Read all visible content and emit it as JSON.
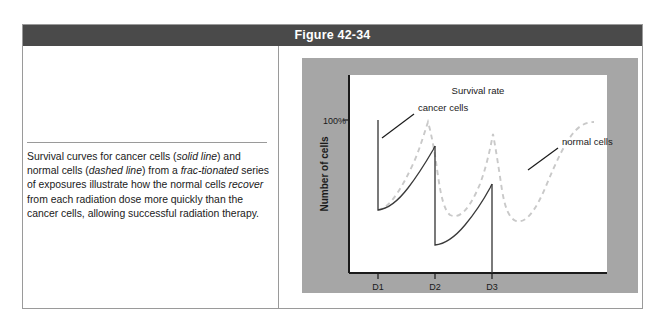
{
  "figure": {
    "title": "Figure 42-34",
    "caption_segments": [
      {
        "text": "Survival curves for cancer cells (",
        "italic": false
      },
      {
        "text": "solid line",
        "italic": true
      },
      {
        "text": ") and normal cells (",
        "italic": false
      },
      {
        "text": "dashed line",
        "italic": true
      },
      {
        "text": ") from a ",
        "italic": false
      },
      {
        "text": "frac-tionated",
        "italic": true
      },
      {
        "text": " series of exposures illustrate how the normal cells ",
        "italic": false
      },
      {
        "text": "recover",
        "italic": true
      },
      {
        "text": " from each radiation dose more quickly than the cancer cells, allowing successful radiation therapy.",
        "italic": false
      }
    ],
    "caption_plain": "Survival curves for cancer cells (solid line) and normal cells (dashed line) from a fractionated series of exposures illustrate how the normal cells recover from each radiation dose more quickly than the cancer cells, allowing successful radiation therapy."
  },
  "chart_data": {
    "type": "line",
    "title": "Survival rate",
    "xlabel": "",
    "ylabel": "Number of cells",
    "x_tick_labels": [
      "D1",
      "D2",
      "D3"
    ],
    "y_tick_labels": [
      "100%"
    ],
    "grid": false,
    "legend_position": "inline-annotations",
    "annotations": [
      {
        "label": "cancer cells",
        "series": "cancer cells"
      },
      {
        "label": "normal cells",
        "series": "normal cells"
      },
      {
        "label": "Survival rate",
        "series": "title"
      }
    ],
    "axis_ranges": {
      "x": [
        0,
        100
      ],
      "y": [
        0,
        100
      ]
    },
    "series": [
      {
        "name": "cancer cells",
        "style": "solid",
        "color": "#3a3a3a",
        "description": "Sawtooth survival curve: each radiation dose (D1, D2, D3) causes a steep vertical drop in cell number, followed by partial exponential recovery that never returns to the previous peak.",
        "points": [
          {
            "x": 12,
            "y": 100,
            "note": "start at 100% before D1"
          },
          {
            "x": 12,
            "y": 28,
            "note": "drop at D1"
          },
          {
            "x": 34,
            "y": 66,
            "note": "partial recovery before D2"
          },
          {
            "x": 34,
            "y": 10,
            "note": "drop at D2"
          },
          {
            "x": 56,
            "y": 50,
            "note": "partial recovery before D3"
          },
          {
            "x": 56,
            "y": 0,
            "note": "drop at D3"
          }
        ]
      },
      {
        "name": "normal cells",
        "style": "dashed",
        "color": "#c9c9c9",
        "description": "Dashed survival curve: each radiation dose causes a drop, but the normal cells recover more quickly and more completely, reaching higher peaks after each dose.",
        "points": [
          {
            "x": 12,
            "y": 26,
            "note": "low point after D1"
          },
          {
            "x": 33,
            "y": 90,
            "note": "strong recovery peak before D2"
          },
          {
            "x": 36,
            "y": 20,
            "note": "drop at D2"
          },
          {
            "x": 55,
            "y": 84,
            "note": "strong recovery peak before D3"
          },
          {
            "x": 60,
            "y": 16,
            "note": "drop at D3"
          },
          {
            "x": 88,
            "y": 92,
            "note": "full recovery plateau after D3"
          }
        ]
      }
    ]
  }
}
